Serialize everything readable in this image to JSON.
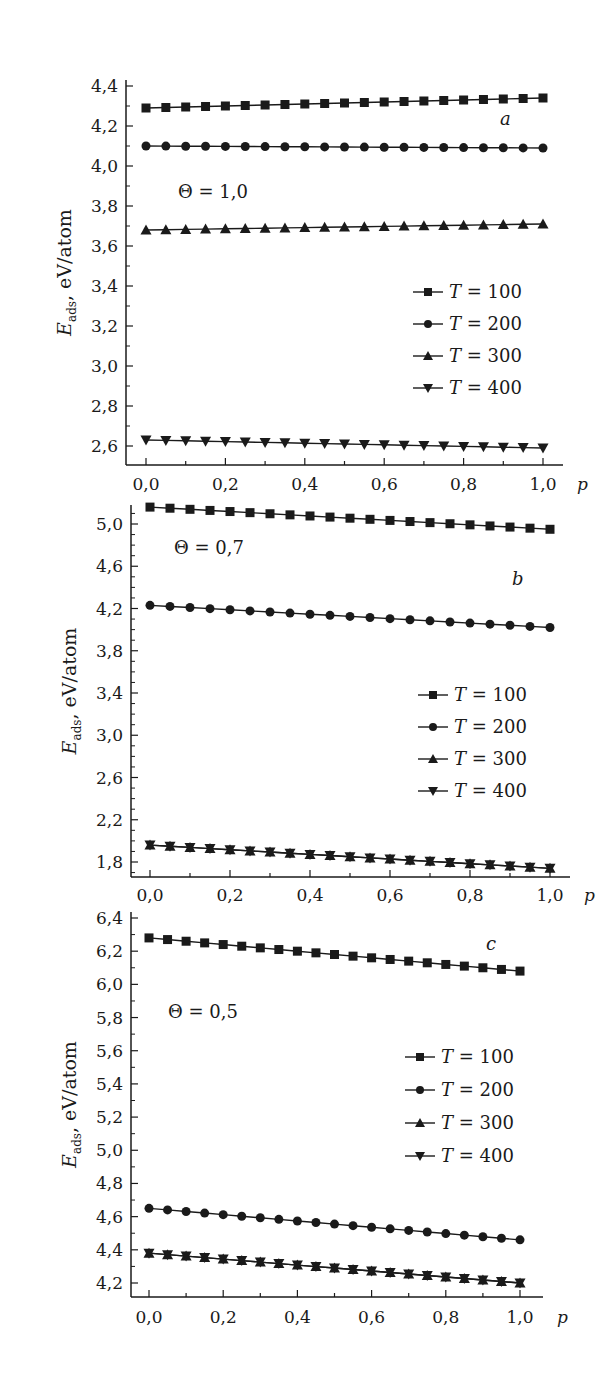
{
  "figure": {
    "y_label_main": "E",
    "y_label_sub": "ads",
    "y_label_unit": ", eV/atom",
    "x_label": "p"
  },
  "chart_data": [
    {
      "type": "line",
      "panel": "a",
      "annotation": "Θ = 1,0",
      "xlabel": "p",
      "ylabel": "E_ads, eV/atom",
      "xlim": [
        0.0,
        1.0
      ],
      "ylim": [
        2.6,
        4.4
      ],
      "x_ticks": [
        "0,0",
        "0,2",
        "0,4",
        "0,6",
        "0,8",
        "1,0"
      ],
      "y_ticks": [
        "2,6",
        "2,8",
        "3,0",
        "3,2",
        "3,4",
        "3,6",
        "3,8",
        "4,0",
        "4,2",
        "4,4"
      ],
      "y_tick_values": [
        2.6,
        2.8,
        3.0,
        3.2,
        3.4,
        3.6,
        3.8,
        4.0,
        4.2,
        4.4
      ],
      "legend_position": "center-right",
      "x": [
        0.0,
        0.05,
        0.1,
        0.15,
        0.2,
        0.25,
        0.3,
        0.35,
        0.4,
        0.45,
        0.5,
        0.55,
        0.6,
        0.65,
        0.7,
        0.75,
        0.8,
        0.85,
        0.9,
        0.95,
        1.0
      ],
      "series": [
        {
          "name": "T = 100",
          "marker": "square",
          "start": 4.29,
          "end": 4.34
        },
        {
          "name": "T = 200",
          "marker": "circle",
          "start": 4.1,
          "end": 4.09
        },
        {
          "name": "T = 300",
          "marker": "triangle-up",
          "start": 3.68,
          "end": 3.71
        },
        {
          "name": "T = 400",
          "marker": "triangle-down",
          "start": 2.63,
          "end": 2.59
        }
      ],
      "layout": {
        "x0": 146,
        "x1": 543,
        "axis_left": 126,
        "axis_right": 563,
        "axis_top": 80,
        "axis_bottom": 465,
        "y_top_val": 4.4,
        "y_top_px": 86,
        "y_bot_val": 2.6,
        "y_bot_px": 446,
        "ann_x": 178,
        "ann_y": 198,
        "letter": "a",
        "letter_x": 500,
        "letter_y": 125,
        "legend_x": 413,
        "legend_y": 292,
        "legend_dy": 32,
        "xlab_y": 490
      }
    },
    {
      "type": "line",
      "panel": "b",
      "annotation": "Θ = 0,7",
      "xlabel": "p",
      "ylabel": "E_ads, eV/atom",
      "xlim": [
        0.0,
        1.0
      ],
      "ylim": [
        1.8,
        5.0
      ],
      "x_ticks": [
        "0,0",
        "0,2",
        "0,4",
        "0,6",
        "0,8",
        "1,0"
      ],
      "y_ticks": [
        "1,8",
        "2,2",
        "2,6",
        "3,0",
        "3,4",
        "3,8",
        "4,2",
        "4,6",
        "5,0"
      ],
      "y_tick_values": [
        1.8,
        2.2,
        2.6,
        3.0,
        3.4,
        3.8,
        4.2,
        4.6,
        5.0
      ],
      "legend_position": "center-right",
      "x": [
        0.0,
        0.05,
        0.1,
        0.15,
        0.2,
        0.25,
        0.3,
        0.35,
        0.4,
        0.45,
        0.5,
        0.55,
        0.6,
        0.65,
        0.7,
        0.75,
        0.8,
        0.85,
        0.9,
        0.95,
        1.0
      ],
      "series": [
        {
          "name": "T = 100",
          "marker": "square",
          "start": 5.16,
          "end": 4.95
        },
        {
          "name": "T = 200",
          "marker": "circle",
          "start": 4.23,
          "end": 4.02
        },
        {
          "name": "T = 300",
          "marker": "triangle-up",
          "start": 1.96,
          "end": 1.74
        },
        {
          "name": "T = 400",
          "marker": "triangle-down",
          "start": 1.96,
          "end": 1.74
        }
      ],
      "layout": {
        "x0": 150,
        "x1": 550,
        "axis_left": 131,
        "axis_right": 570,
        "axis_top": 505,
        "axis_bottom": 877,
        "y_top_val": 5.0,
        "y_top_px": 524,
        "y_bot_val": 1.8,
        "y_bot_px": 862,
        "ann_x": 174,
        "ann_y": 554,
        "letter": "b",
        "letter_x": 512,
        "letter_y": 585,
        "legend_x": 418,
        "legend_y": 695,
        "legend_dy": 32,
        "xlab_y": 901
      }
    },
    {
      "type": "line",
      "panel": "c",
      "annotation": "Θ = 0,5",
      "xlabel": "p",
      "ylabel": "E_ads, eV/atom",
      "xlim": [
        0.0,
        1.0
      ],
      "ylim": [
        4.2,
        6.4
      ],
      "x_ticks": [
        "0,0",
        "0,2",
        "0,4",
        "0,6",
        "0,8",
        "1,0"
      ],
      "y_ticks": [
        "4,2",
        "4,4",
        "4,6",
        "4,8",
        "5,0",
        "5,2",
        "5,4",
        "5,6",
        "5,8",
        "6,0",
        "6,2",
        "6,4"
      ],
      "y_tick_values": [
        4.2,
        4.4,
        4.6,
        4.8,
        5.0,
        5.2,
        5.4,
        5.6,
        5.8,
        6.0,
        6.2,
        6.4
      ],
      "legend_position": "center-right",
      "x": [
        0.0,
        0.05,
        0.1,
        0.15,
        0.2,
        0.25,
        0.3,
        0.35,
        0.4,
        0.45,
        0.5,
        0.55,
        0.6,
        0.65,
        0.7,
        0.75,
        0.8,
        0.85,
        0.9,
        0.95,
        1.0
      ],
      "series": [
        {
          "name": "T = 100",
          "marker": "square",
          "start": 6.28,
          "end": 6.08
        },
        {
          "name": "T = 200",
          "marker": "circle",
          "start": 4.65,
          "end": 4.46
        },
        {
          "name": "T = 300",
          "marker": "triangle-up",
          "start": 4.38,
          "end": 4.2
        },
        {
          "name": "T = 400",
          "marker": "triangle-down",
          "start": 4.38,
          "end": 4.2
        }
      ],
      "layout": {
        "x0": 149,
        "x1": 520,
        "axis_left": 131,
        "axis_right": 543,
        "axis_top": 912,
        "axis_bottom": 1297,
        "y_top_val": 6.4,
        "y_top_px": 918,
        "y_bot_val": 4.2,
        "y_bot_px": 1283,
        "ann_x": 168,
        "ann_y": 1018,
        "letter": "c",
        "letter_x": 486,
        "letter_y": 950,
        "legend_x": 405,
        "legend_y": 1057,
        "legend_dy": 33,
        "xlab_y": 1323
      }
    }
  ]
}
